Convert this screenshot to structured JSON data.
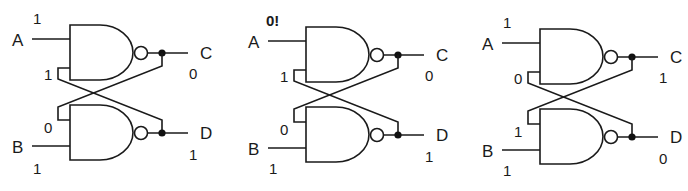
{
  "diagram": {
    "type": "SR latch built from two cross-coupled NAND gates",
    "panels": [
      {
        "id": "panel-1",
        "inputs": {
          "A": {
            "label": "A",
            "value": "1"
          },
          "B": {
            "label": "B",
            "value": "1"
          }
        },
        "feedback": {
          "top_gate_lower_input": "1",
          "bottom_gate_upper_input": "0"
        },
        "outputs": {
          "C": {
            "label": "C",
            "value": "0"
          },
          "D": {
            "label": "D",
            "value": "1"
          }
        }
      },
      {
        "id": "panel-2",
        "inputs": {
          "A": {
            "label": "A",
            "value": "0!"
          },
          "B": {
            "label": "B",
            "value": "1"
          }
        },
        "feedback": {
          "top_gate_lower_input": "1",
          "bottom_gate_upper_input": "0"
        },
        "outputs": {
          "C": {
            "label": "C",
            "value": "0"
          },
          "D": {
            "label": "D",
            "value": "1"
          }
        }
      },
      {
        "id": "panel-3",
        "inputs": {
          "A": {
            "label": "A",
            "value": "1"
          },
          "B": {
            "label": "B",
            "value": "1"
          }
        },
        "feedback": {
          "top_gate_lower_input": "0",
          "bottom_gate_upper_input": "1"
        },
        "outputs": {
          "C": {
            "label": "C",
            "value": "1"
          },
          "D": {
            "label": "D",
            "value": "0"
          }
        }
      }
    ],
    "colors": {
      "line": "#1a1a1a",
      "background": "#ffffff"
    }
  }
}
